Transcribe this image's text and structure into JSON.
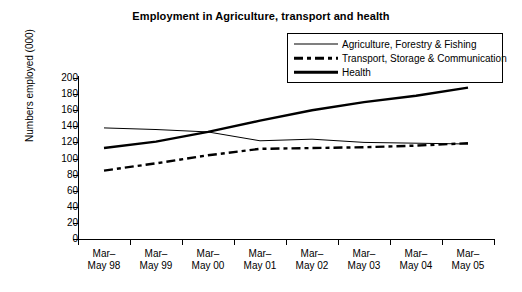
{
  "chart_data": {
    "type": "line",
    "title": "Employment in Agriculture, transport and health",
    "xlabel": "",
    "ylabel": "Numbers employed (000)",
    "ylim": [
      0,
      200
    ],
    "yticks": [
      0,
      20,
      40,
      60,
      80,
      100,
      120,
      140,
      160,
      180,
      200
    ],
    "grid": false,
    "legend_position": "top-right",
    "categories": [
      "Mar–\nMay 98",
      "Mar–\nMay 99",
      "Mar–\nMay 00",
      "Mar–\nMay 01",
      "Mar–\nMay 02",
      "Mar–\nMay 03",
      "Mar–\nMay 04",
      "Mar–\nMay 05"
    ],
    "categories_flat": [
      "Mar–May 98",
      "Mar–May 99",
      "Mar–May 00",
      "Mar–May 01",
      "Mar–May 02",
      "Mar–May 03",
      "Mar–May 04",
      "Mar–May 05"
    ],
    "series": [
      {
        "name": "Agriculture, Forestry & Fishing",
        "style": "thin-solid",
        "color": "#000000",
        "values": [
          138,
          136,
          133,
          122,
          124,
          120,
          119,
          118
        ]
      },
      {
        "name": "Transport, Storage & Communication",
        "style": "thick-dash-dot",
        "color": "#000000",
        "values": [
          85,
          94,
          104,
          112,
          113,
          114,
          116,
          119
        ]
      },
      {
        "name": "Health",
        "style": "thick-solid",
        "color": "#000000",
        "values": [
          113,
          121,
          133,
          147,
          160,
          170,
          178,
          188
        ]
      }
    ]
  },
  "legend": {
    "items": [
      {
        "label": "Agriculture, Forestry & Fishing",
        "key": "thin-solid"
      },
      {
        "label": "Transport, Storage & Communication",
        "key": "thick-dash-dot"
      },
      {
        "label": "Health",
        "key": "thick-solid"
      }
    ]
  }
}
